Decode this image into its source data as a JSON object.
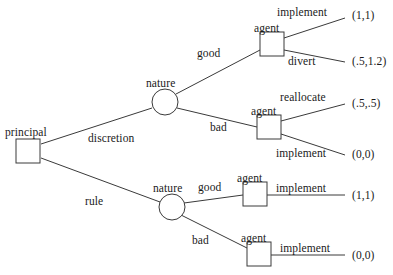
{
  "diagram": {
    "type": "game-tree",
    "stroke_color": "#3a3a3a",
    "text_color": "#1a1a1a",
    "background": "#ffffff"
  },
  "nodes": [
    {
      "id": "principal",
      "label": "principal",
      "shape": "square",
      "x": 28,
      "y": 151,
      "size": 24,
      "label_x": 5,
      "label_y": 127
    },
    {
      "id": "nature-top",
      "label": "nature",
      "shape": "circle",
      "x": 165,
      "y": 102,
      "size": 26,
      "label_x": 146,
      "label_y": 78
    },
    {
      "id": "agent-good",
      "label": "agent",
      "shape": "square",
      "x": 272,
      "y": 44,
      "size": 24,
      "label_x": 254,
      "label_y": 23
    },
    {
      "id": "agent-bad",
      "label": "agent",
      "shape": "square",
      "x": 269,
      "y": 127,
      "size": 24,
      "label_x": 251,
      "label_y": 106
    },
    {
      "id": "nature-bot",
      "label": "nature",
      "shape": "circle",
      "x": 172,
      "y": 207,
      "size": 26,
      "label_x": 153,
      "label_y": 183
    },
    {
      "id": "agent-rgood",
      "label": "agent",
      "shape": "square",
      "x": 255,
      "y": 194,
      "size": 24,
      "label_x": 237,
      "label_y": 173
    },
    {
      "id": "agent-rbad",
      "label": "agent",
      "shape": "square",
      "x": 259,
      "y": 254,
      "size": 24,
      "label_x": 241,
      "label_y": 233
    }
  ],
  "edges": [
    {
      "id": "e-discretion",
      "label": "discretion",
      "from": "principal",
      "to": "nature-top",
      "x1": 41,
      "y1": 144,
      "x2": 152,
      "y2": 108,
      "label_x": 88,
      "label_y": 133
    },
    {
      "id": "e-rule",
      "label": "rule",
      "from": "principal",
      "to": "nature-bot",
      "x1": 41,
      "y1": 158,
      "x2": 160,
      "y2": 202,
      "label_x": 85,
      "label_y": 196
    },
    {
      "id": "e-good-top",
      "label": "good",
      "from": "nature-top",
      "to": "agent-good",
      "x1": 176,
      "y1": 94,
      "x2": 260,
      "y2": 50,
      "label_x": 197,
      "label_y": 48
    },
    {
      "id": "e-bad-top",
      "label": "bad",
      "from": "nature-top",
      "to": "agent-bad",
      "x1": 177,
      "y1": 108,
      "x2": 257,
      "y2": 127,
      "label_x": 210,
      "label_y": 122
    },
    {
      "id": "e-implement1",
      "label": "implement",
      "from": "agent-good",
      "to": "payoff-1",
      "x1": 284,
      "y1": 38,
      "x2": 345,
      "y2": 18,
      "label_x": 277,
      "label_y": 7
    },
    {
      "id": "e-divert",
      "label": "divert",
      "from": "agent-good",
      "to": "payoff-2",
      "x1": 284,
      "y1": 50,
      "x2": 345,
      "y2": 62,
      "label_x": 288,
      "label_y": 56
    },
    {
      "id": "e-reallocate",
      "label": "reallocate",
      "from": "agent-bad",
      "to": "payoff-3",
      "x1": 281,
      "y1": 121,
      "x2": 345,
      "y2": 104,
      "label_x": 280,
      "label_y": 92
    },
    {
      "id": "e-implement2",
      "label": "implement",
      "from": "agent-bad",
      "to": "payoff-4",
      "x1": 281,
      "y1": 134,
      "x2": 345,
      "y2": 155,
      "label_x": 276,
      "label_y": 148
    },
    {
      "id": "e-good-bot",
      "label": "good",
      "from": "nature-bot",
      "to": "agent-rgood",
      "x1": 184,
      "y1": 203,
      "x2": 243,
      "y2": 195,
      "label_x": 198,
      "label_y": 182
    },
    {
      "id": "e-bad-bot",
      "label": "bad",
      "from": "nature-bot",
      "to": "agent-rbad",
      "x1": 181,
      "y1": 215,
      "x2": 247,
      "y2": 248,
      "label_x": 192,
      "label_y": 235
    },
    {
      "id": "e-implement3",
      "label": "implement",
      "from": "agent-rgood",
      "to": "payoff-5",
      "x1": 267,
      "y1": 195,
      "x2": 345,
      "y2": 195,
      "label_x": 276,
      "label_y": 183
    },
    {
      "id": "e-implement4",
      "label": "implement",
      "from": "agent-rbad",
      "to": "payoff-6",
      "x1": 271,
      "y1": 255,
      "x2": 345,
      "y2": 255,
      "label_x": 280,
      "label_y": 243
    }
  ],
  "payoffs": [
    {
      "id": "payoff-1",
      "value": "(1,1)",
      "x": 352,
      "y": 10
    },
    {
      "id": "payoff-2",
      "value": "(.5,1.2)",
      "x": 352,
      "y": 56
    },
    {
      "id": "payoff-3",
      "value": "(.5,.5)",
      "x": 352,
      "y": 98
    },
    {
      "id": "payoff-4",
      "value": "(0,0)",
      "x": 352,
      "y": 149
    },
    {
      "id": "payoff-5",
      "value": "(1,1)",
      "x": 352,
      "y": 190
    },
    {
      "id": "payoff-6",
      "value": "(0,0)",
      "x": 352,
      "y": 250
    }
  ],
  "chart_data": {
    "type": "diagram",
    "decision_sequence": [
      {
        "player": "principal",
        "action": "discretion",
        "then": {
          "player": "nature",
          "branches": [
            {
              "state": "good",
              "player": "agent",
              "actions": [
                {
                  "action": "implement",
                  "payoff": "(1,1)"
                },
                {
                  "action": "divert",
                  "payoff": "(.5,1.2)"
                }
              ]
            },
            {
              "state": "bad",
              "player": "agent",
              "actions": [
                {
                  "action": "reallocate",
                  "payoff": "(.5,.5)"
                },
                {
                  "action": "implement",
                  "payoff": "(0,0)"
                }
              ]
            }
          ]
        }
      },
      {
        "player": "principal",
        "action": "rule",
        "then": {
          "player": "nature",
          "branches": [
            {
              "state": "good",
              "player": "agent",
              "actions": [
                {
                  "action": "implement",
                  "payoff": "(1,1)"
                }
              ]
            },
            {
              "state": "bad",
              "player": "agent",
              "actions": [
                {
                  "action": "implement",
                  "payoff": "(0,0)"
                }
              ]
            }
          ]
        }
      }
    ]
  }
}
